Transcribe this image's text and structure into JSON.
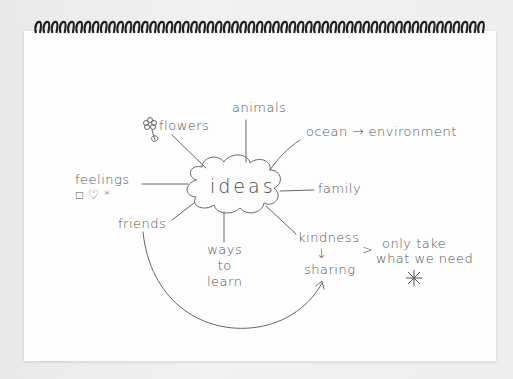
{
  "notebook": {
    "binding": "spiral",
    "paper_color": "#fdfdfd",
    "ink_color": "#555555"
  },
  "mind_map": {
    "center": {
      "label": "ideas",
      "shape": "cloud"
    },
    "branches": [
      {
        "id": "flowers",
        "label": "flowers",
        "icon": "flower-icon"
      },
      {
        "id": "animals",
        "label": "animals"
      },
      {
        "id": "ocean",
        "label": "ocean",
        "arrow_to": "environment"
      },
      {
        "id": "environment",
        "label": "environment"
      },
      {
        "id": "feelings",
        "label": "feelings",
        "symbols": [
          "□",
          "♡",
          "*"
        ]
      },
      {
        "id": "family",
        "label": "family"
      },
      {
        "id": "friends",
        "label": "friends",
        "arrow_to": "sharing"
      },
      {
        "id": "ways_to_learn",
        "label_lines": [
          "ways",
          "to",
          "learn"
        ]
      },
      {
        "id": "kindness",
        "label": "kindness",
        "arrow_to": "sharing"
      },
      {
        "id": "sharing",
        "label": "sharing"
      }
    ],
    "note": {
      "marker": ">",
      "lines": [
        "only take",
        "what we need"
      ],
      "symbol": "*"
    },
    "arrow_glyph": "→",
    "down_arrow_glyph": "↓"
  }
}
